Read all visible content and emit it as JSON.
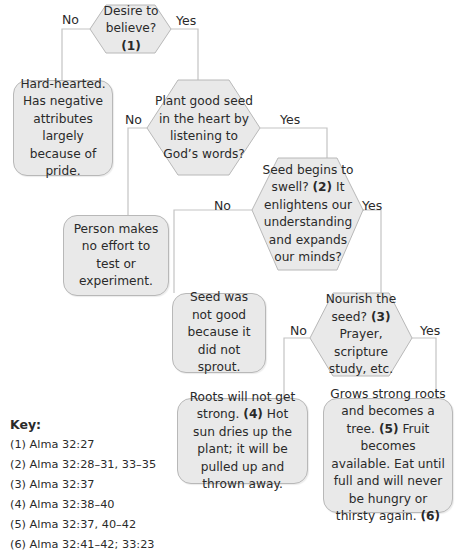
{
  "diagram": {
    "colors": {
      "fill": "#e9e9e9",
      "stroke": "#b8b8b8",
      "text": "#2a2a2a",
      "line": "#bdbdbd"
    },
    "decisions": [
      {
        "id": "q1",
        "text": "Desire to believe?",
        "ref": "(1)"
      },
      {
        "id": "q2",
        "text": "Plant good seed in the heart by listening to God’s words?"
      },
      {
        "id": "q3",
        "text_a": "Seed begins to swell?",
        "ref": "(2)",
        "text_b": "It enlightens our understanding and expands our minds?"
      },
      {
        "id": "q4",
        "text_a": "Nourish the seed?",
        "ref": "(3)",
        "text_b": "Prayer, scripture study, etc."
      }
    ],
    "outcomes": [
      {
        "id": "o1",
        "text": "Hard-hearted. Has negative attributes largely because of pride."
      },
      {
        "id": "o2",
        "text": "Person makes no effort to test or experiment."
      },
      {
        "id": "o3",
        "text": "Seed was not good because it did not sprout."
      },
      {
        "id": "o4",
        "text_a": "Roots will not get strong.",
        "ref": "(4)",
        "text_b": "Hot sun dries up the plant; it will be pulled up and thrown away."
      },
      {
        "id": "o5",
        "text_a": "Grows strong roots and becomes a tree.",
        "ref_a": "(5)",
        "text_b": "Fruit becomes available. Eat until full and will never be hungry or thirsty again.",
        "ref_b": "(6)"
      }
    ],
    "branch_labels": {
      "no": "No",
      "yes": "Yes"
    }
  },
  "key": {
    "title": "Key:",
    "items": [
      "(1) Alma 32:27",
      "(2) Alma 32:28–31, 33–35",
      "(3) Alma 32:37",
      "(4) Alma 32:38–40",
      "(5) Alma 32:37, 40–42",
      "(6) Alma 32:41–42; 33:23"
    ]
  }
}
